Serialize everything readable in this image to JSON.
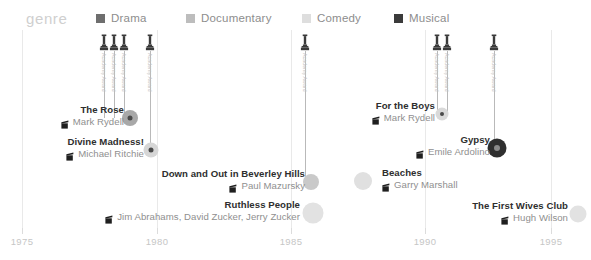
{
  "header": {
    "genre_label": "genre",
    "legend": [
      {
        "label": "Drama",
        "color": "#6e6e6e",
        "x": 96
      },
      {
        "label": "Documentary",
        "color": "#bdbdbd",
        "x": 186
      },
      {
        "label": "Comedy",
        "color": "#dedede",
        "x": 302
      },
      {
        "label": "Musical",
        "color": "#3b3b3b",
        "x": 394
      }
    ]
  },
  "axis": {
    "ticks": [
      {
        "year": "1975",
        "x": 22
      },
      {
        "year": "1980",
        "x": 157
      },
      {
        "year": "1985",
        "x": 291
      },
      {
        "year": "1990",
        "x": 425
      },
      {
        "year": "1995",
        "x": 551
      }
    ],
    "grid_top": 30,
    "grid_bottom": 228
  },
  "awards": [
    {
      "caption": "Academy Award",
      "x": 104,
      "icon_top": 34,
      "stem_top": 51,
      "stem_bottom": 118
    },
    {
      "caption": "Academy Award",
      "x": 114,
      "icon_top": 34,
      "stem_top": 51,
      "stem_bottom": 118
    },
    {
      "caption": "Academy Award",
      "x": 124,
      "icon_top": 34,
      "stem_top": 51,
      "stem_bottom": 118
    },
    {
      "caption": "Academy Award",
      "x": 150,
      "icon_top": 34,
      "stem_top": 51,
      "stem_bottom": 150
    },
    {
      "caption": "Academy Award",
      "x": 305,
      "icon_top": 34,
      "stem_top": 51,
      "stem_bottom": 182
    },
    {
      "caption": "Academy Award",
      "x": 437,
      "icon_top": 34,
      "stem_top": 51,
      "stem_bottom": 114
    },
    {
      "caption": "Academy Award",
      "x": 447,
      "icon_top": 34,
      "stem_top": 51,
      "stem_bottom": 114
    },
    {
      "caption": "Academy Award",
      "x": 494,
      "icon_top": 34,
      "stem_top": 51,
      "stem_bottom": 148
    }
  ],
  "chart_data": {
    "type": "scatter",
    "title": "genre",
    "xlabel": "",
    "ylabel": "",
    "xlim": [
      1975,
      1996
    ],
    "grid": true,
    "legend_position": "top",
    "categories": [
      "Drama",
      "Documentary",
      "Comedy",
      "Musical"
    ],
    "films": [
      {
        "title": "The Rose",
        "director": "Mark Rydell",
        "genre": "Drama",
        "year": 1979,
        "x": 130,
        "y": 118,
        "dot_size": 16,
        "dot_color": "#a8a8a8",
        "ring": true,
        "label_right": 124,
        "label_top": 104
      },
      {
        "title": "Divine Madness!",
        "director": "Michael Ritchie",
        "genre": "Documentary",
        "year": 1980,
        "x": 151,
        "y": 150,
        "dot_size": 15,
        "dot_color": "#d6d6d6",
        "ring": true,
        "label_right": 144,
        "label_top": 136
      },
      {
        "title": "Down and Out in Beverley Hills",
        "director": "Paul Mazursky",
        "genre": "Comedy",
        "year": 1986,
        "x": 311,
        "y": 182,
        "dot_size": 16,
        "dot_color": "#c9c9c9",
        "ring": false,
        "label_right": 305,
        "label_top": 168
      },
      {
        "title": "Ruthless People",
        "director": "Jim Abrahams, David Zucker, Jerry Zucker",
        "genre": "Comedy",
        "year": 1986,
        "x": 313,
        "y": 213,
        "dot_size": 21,
        "dot_color": "#e2e2e2",
        "ring": false,
        "label_right": 300,
        "label_top": 199
      },
      {
        "title": "For the Boys",
        "director": "Mark Rydell",
        "genre": "Drama",
        "year": 1991,
        "x": 442,
        "y": 114,
        "dot_size": 13,
        "dot_color": "#d9d9d9",
        "ring": true,
        "label_right": 435,
        "label_top": 100
      },
      {
        "title": "Gypsy",
        "director": "Emile Ardolino",
        "genre": "Musical",
        "year": 1993,
        "x": 497,
        "y": 148,
        "dot_size": 19,
        "dot_color": "#2f2f2f",
        "ring": true,
        "label_right": 490,
        "label_top": 134
      },
      {
        "title": "Beaches",
        "director": "Garry Marshall",
        "genre": "Comedy",
        "year": 1988,
        "x": 363,
        "y": 181,
        "dot_size": 18,
        "dot_color": "#e0e0e0",
        "ring": false,
        "label_right": 382,
        "label_top": 167,
        "label_align": "left"
      },
      {
        "title": "The First Wives Club",
        "director": "Hugh Wilson",
        "genre": "Comedy",
        "year": 1996,
        "x": 578,
        "y": 214,
        "dot_size": 17,
        "dot_color": "#e2e2e2",
        "ring": false,
        "label_right": 568,
        "label_top": 200
      }
    ]
  }
}
